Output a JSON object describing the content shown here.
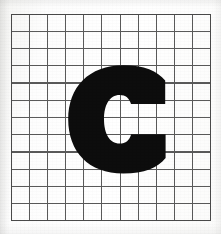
{
  "image": {
    "title": "Handwriting sample grid with letter C",
    "width": 221,
    "height": 234,
    "background_color": "#fdfdfc",
    "description": "A bold black uppercase letter C drawn on a sheet of square graph paper."
  },
  "grid": {
    "name": "graph-paper-grid",
    "columns": 11,
    "rows": 12,
    "left": 11,
    "top": 14,
    "width": 200,
    "height": 207,
    "cell_width": 18.18,
    "cell_height": 17.25,
    "line_color": "#5a5a5a",
    "border_color": "#4a4a4a",
    "line_width": 1.1,
    "border_width": 1.4
  },
  "glyph": {
    "name": "letter-c",
    "character": "C",
    "case": "uppercase",
    "color": "#0d0d0d",
    "bounds": {
      "left": 68,
      "top": 66,
      "right": 166,
      "bottom": 173,
      "width": 98,
      "height": 107
    },
    "stroke_thickness": 27,
    "counter_color": "#ffffff"
  }
}
